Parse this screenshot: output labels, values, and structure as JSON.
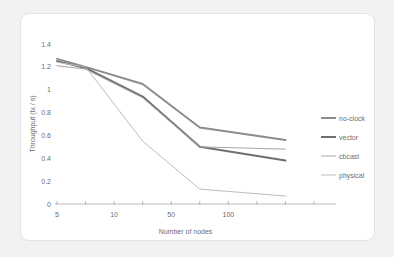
{
  "figure": {
    "background_color": "#f2f2f2",
    "card_color": "#ffffff",
    "card_border_color": "#e3e3e3"
  },
  "chart_data": {
    "type": "line",
    "title": "",
    "xlabel": "Number of nodes",
    "ylabel": "Throughput (tx / s)",
    "x": [
      5,
      10,
      50,
      100,
      200
    ],
    "x_positions": [
      1,
      2,
      4,
      6,
      9
    ],
    "xtick_positions": [
      1,
      2,
      3,
      4,
      5,
      6,
      7,
      8,
      9,
      10
    ],
    "xtick_labels": [
      "5",
      "",
      "10",
      "",
      "50",
      "",
      "100",
      "",
      "",
      ""
    ],
    "xtick_labels_visible": [
      "5",
      "10",
      "50",
      "100"
    ],
    "ylim": [
      0,
      1.4
    ],
    "ytick_labels": [
      "0",
      "0.2",
      "0.4",
      "0.6",
      "0.8",
      "1",
      "1.2",
      "1.4"
    ],
    "ytick_values": [
      0,
      0.2,
      0.4,
      0.6,
      0.8,
      1.0,
      1.2,
      1.4
    ],
    "grid": false,
    "legend_position": "right",
    "series": [
      {
        "name": "no-clock",
        "color": "#8c8c8c",
        "width": 2.0,
        "values": [
          1.27,
          1.2,
          1.05,
          0.67,
          0.56
        ]
      },
      {
        "name": "vector",
        "color": "#707070",
        "width": 2.0,
        "values": [
          1.25,
          1.19,
          0.94,
          0.5,
          0.38
        ]
      },
      {
        "name": "cbcast",
        "color": "#a6a6a6",
        "width": 1.0,
        "values": [
          1.21,
          1.18,
          0.93,
          0.5,
          0.48
        ]
      },
      {
        "name": "physical",
        "color": "#bdbdbd",
        "width": 1.0,
        "values": [
          1.24,
          1.2,
          0.55,
          0.13,
          0.07
        ]
      }
    ]
  },
  "legend": {
    "entries": [
      {
        "label": "no-clock"
      },
      {
        "label": "vector"
      },
      {
        "label": "cbcast"
      },
      {
        "label": "physical"
      }
    ]
  }
}
